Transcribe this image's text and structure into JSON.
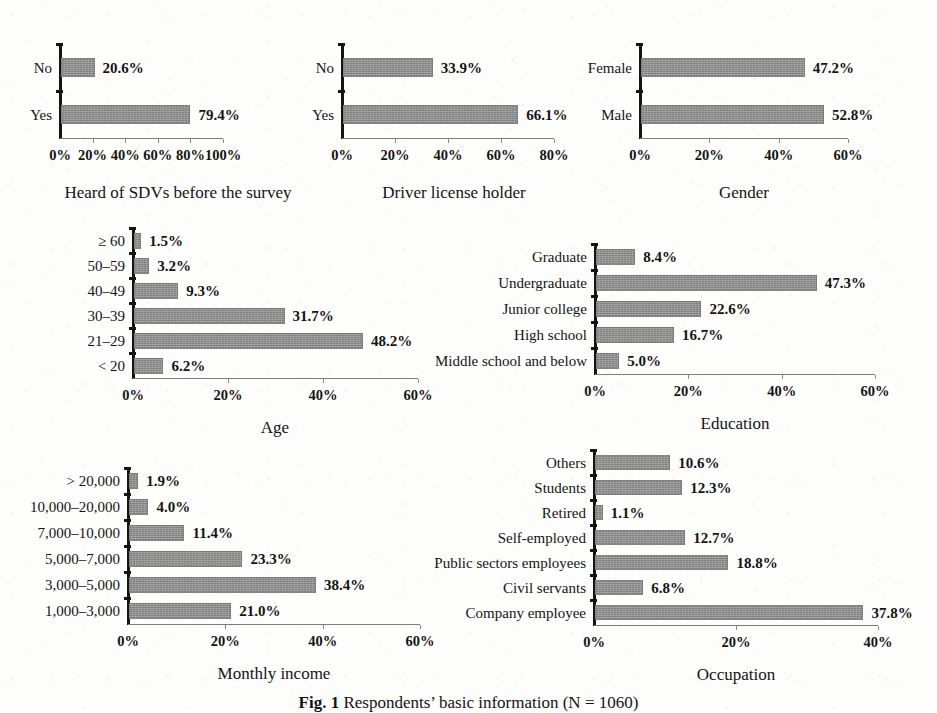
{
  "figure": {
    "caption_label": "Fig. 1",
    "caption_text": "Respondents’ basic information (N = 1060)"
  },
  "chart_data": [
    {
      "id": "heard-of-sdvs",
      "type": "bar",
      "orientation": "horizontal",
      "title": "Heard of SDVs before the survey",
      "xlabel": "",
      "ylabel": "",
      "categories": [
        "Yes",
        "No"
      ],
      "values": [
        79.4,
        20.6
      ],
      "value_labels": [
        "79.4%",
        "20.6%"
      ],
      "xlim": [
        0,
        100
      ],
      "xticks": [
        0,
        20,
        40,
        60,
        80,
        100
      ],
      "xtick_labels": [
        "0%",
        "20%",
        "40%",
        "60%",
        "80%",
        "100%"
      ],
      "grid": false,
      "legend": "none"
    },
    {
      "id": "driver-license-holder",
      "type": "bar",
      "orientation": "horizontal",
      "title": "Driver license holder",
      "xlabel": "",
      "ylabel": "",
      "categories": [
        "Yes",
        "No"
      ],
      "values": [
        66.1,
        33.9
      ],
      "value_labels": [
        "66.1%",
        "33.9%"
      ],
      "xlim": [
        0,
        80
      ],
      "xticks": [
        0,
        20,
        40,
        60,
        80
      ],
      "xtick_labels": [
        "0%",
        "20%",
        "40%",
        "60%",
        "80%"
      ],
      "grid": false,
      "legend": "none"
    },
    {
      "id": "gender",
      "type": "bar",
      "orientation": "horizontal",
      "title": "Gender",
      "xlabel": "",
      "ylabel": "",
      "categories": [
        "Male",
        "Female"
      ],
      "values": [
        52.8,
        47.2
      ],
      "value_labels": [
        "52.8%",
        "47.2%"
      ],
      "xlim": [
        0,
        60
      ],
      "xticks": [
        0,
        20,
        40,
        60
      ],
      "xtick_labels": [
        "0%",
        "20%",
        "40%",
        "60%"
      ],
      "grid": false,
      "legend": "none"
    },
    {
      "id": "age",
      "type": "bar",
      "orientation": "horizontal",
      "title": "Age",
      "xlabel": "",
      "ylabel": "",
      "categories": [
        "< 20",
        "21–29",
        "30–39",
        "40–49",
        "50–59",
        "≥ 60"
      ],
      "values": [
        6.2,
        48.2,
        31.7,
        9.3,
        3.2,
        1.5
      ],
      "value_labels": [
        "6.2%",
        "48.2%",
        "31.7%",
        "9.3%",
        "3.2%",
        "1.5%"
      ],
      "xlim": [
        0,
        60
      ],
      "xticks": [
        0,
        20,
        40,
        60
      ],
      "xtick_labels": [
        "0%",
        "20%",
        "40%",
        "60%"
      ],
      "grid": false,
      "legend": "none"
    },
    {
      "id": "education",
      "type": "bar",
      "orientation": "horizontal",
      "title": "Education",
      "xlabel": "",
      "ylabel": "",
      "categories": [
        "Middle school and below",
        "High school",
        "Junior college",
        "Undergraduate",
        "Graduate"
      ],
      "values": [
        5.0,
        16.7,
        22.6,
        47.3,
        8.4
      ],
      "value_labels": [
        "5.0%",
        "16.7%",
        "22.6%",
        "47.3%",
        "8.4%"
      ],
      "xlim": [
        0,
        60
      ],
      "xticks": [
        0,
        20,
        40,
        60
      ],
      "xtick_labels": [
        "0%",
        "20%",
        "40%",
        "60%"
      ],
      "grid": false,
      "legend": "none"
    },
    {
      "id": "monthly-income",
      "type": "bar",
      "orientation": "horizontal",
      "title": "Monthly income",
      "xlabel": "",
      "ylabel": "",
      "categories": [
        "1,000–3,000",
        "3,000–5,000",
        "5,000–7,000",
        "7,000–10,000",
        "10,000–20,000",
        "> 20,000"
      ],
      "values": [
        21.0,
        38.4,
        23.3,
        11.4,
        4.0,
        1.9
      ],
      "value_labels": [
        "21.0%",
        "38.4%",
        "23.3%",
        "11.4%",
        "4.0%",
        "1.9%"
      ],
      "xlim": [
        0,
        60
      ],
      "xticks": [
        0,
        20,
        40,
        60
      ],
      "xtick_labels": [
        "0%",
        "20%",
        "40%",
        "60%"
      ],
      "grid": false,
      "legend": "none"
    },
    {
      "id": "occupation",
      "type": "bar",
      "orientation": "horizontal",
      "title": "Occupation",
      "xlabel": "",
      "ylabel": "",
      "categories": [
        "Company employee",
        "Civil servants",
        "Public sectors employees",
        "Self-employed",
        "Retired",
        "Students",
        "Others"
      ],
      "values": [
        37.8,
        6.8,
        18.8,
        12.7,
        1.1,
        12.3,
        10.6
      ],
      "value_labels": [
        "37.8%",
        "6.8%",
        "18.8%",
        "12.7%",
        "1.1%",
        "12.3%",
        "10.6%"
      ],
      "xlim": [
        0,
        40
      ],
      "xticks": [
        0,
        20,
        40
      ],
      "xtick_labels": [
        "0%",
        "20%",
        "40%"
      ],
      "grid": false,
      "legend": "none"
    }
  ],
  "style": {
    "bar_color": "#8c8c8c",
    "axis_color": "#141414",
    "text_color": "#141414",
    "background": "#fdfdfc"
  },
  "layout": {
    "panels": [
      {
        "id": "heard-of-sdvs",
        "left": 60,
        "top": 44,
        "plot_w": 163,
        "bar_h": 19,
        "slot_h": 47,
        "label_w": 56,
        "title_dx": 118,
        "title_dy": 46
      },
      {
        "id": "driver-license-holder",
        "left": 342,
        "top": 44,
        "plot_w": 212,
        "bar_h": 19,
        "slot_h": 47,
        "label_w": 56,
        "title_dx": 112,
        "title_dy": 46
      },
      {
        "id": "gender",
        "left": 640,
        "top": 44,
        "plot_w": 208,
        "bar_h": 19,
        "slot_h": 47,
        "label_w": 66,
        "title_dx": 104,
        "title_dy": 46
      },
      {
        "id": "age",
        "left": 133,
        "top": 228,
        "plot_w": 285,
        "bar_h": 16,
        "slot_h": 25,
        "label_w": 66,
        "title_dx": 142,
        "title_dy": 41
      },
      {
        "id": "education",
        "left": 595,
        "top": 244,
        "plot_w": 280,
        "bar_h": 16,
        "slot_h": 26,
        "label_w": 153,
        "title_dx": 140,
        "title_dy": 41
      },
      {
        "id": "monthly-income",
        "left": 128,
        "top": 468,
        "plot_w": 292,
        "bar_h": 16,
        "slot_h": 26,
        "label_w": 108,
        "title_dx": 146,
        "title_dy": 41
      },
      {
        "id": "occupation",
        "left": 594,
        "top": 450,
        "plot_w": 284,
        "bar_h": 15,
        "slot_h": 25,
        "label_w": 157,
        "title_dx": 142,
        "title_dy": 41
      }
    ]
  }
}
